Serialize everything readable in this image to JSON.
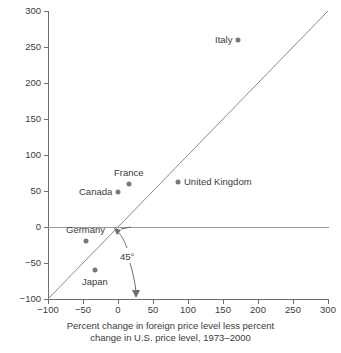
{
  "chart_data": {
    "type": "scatter",
    "title": "",
    "subtitle": "",
    "caption_line1": "Percent change in foreign price level less percent",
    "caption_line2": "change in U.S. price level, 1973–2000",
    "xlabel": "",
    "ylabel": "",
    "xlim": [
      -100,
      300
    ],
    "ylim": [
      -100,
      300
    ],
    "xticks": [
      -100,
      -50,
      0,
      50,
      100,
      150,
      200,
      250,
      300
    ],
    "yticks": [
      -100,
      -50,
      0,
      50,
      100,
      150,
      200,
      250,
      300
    ],
    "xtick_labels": [
      "−100",
      "−50",
      "0",
      "50",
      "100",
      "150",
      "200",
      "250",
      "300"
    ],
    "ytick_labels": [
      "−100",
      "−50",
      "0",
      "50",
      "100",
      "150",
      "200",
      "250",
      "300"
    ],
    "grid": false,
    "legend": "none",
    "points": [
      {
        "name": "Italy",
        "x": 172,
        "y": 260,
        "label_pos": "left"
      },
      {
        "name": "United Kingdom",
        "x": 85,
        "y": 62,
        "label_pos": "right"
      },
      {
        "name": "France",
        "x": 15,
        "y": 60,
        "label_pos": "above"
      },
      {
        "name": "Canada",
        "x": 0,
        "y": 49,
        "label_pos": "left"
      },
      {
        "name": "Germany",
        "x": -46,
        "y": -20,
        "label_pos": "above"
      },
      {
        "name": "Japan",
        "x": -33,
        "y": -60,
        "label_pos": "below"
      }
    ],
    "reference_lines": [
      {
        "name": "45-degree-line",
        "type": "identity",
        "from": [
          -100,
          -100
        ],
        "to": [
          300,
          300
        ],
        "annotation": "45°"
      },
      {
        "name": "zero-line",
        "type": "horizontal",
        "value": 0
      }
    ],
    "annotations": [
      {
        "name": "angle-annotation",
        "text": "45°"
      }
    ],
    "colors": {
      "marker": "#787878",
      "axis": "#6e6e6e",
      "reference_line": "#8a8a8a",
      "zero_line": "#9a9a9a",
      "text": "#3b3b3b",
      "background": "#ffffff"
    }
  }
}
